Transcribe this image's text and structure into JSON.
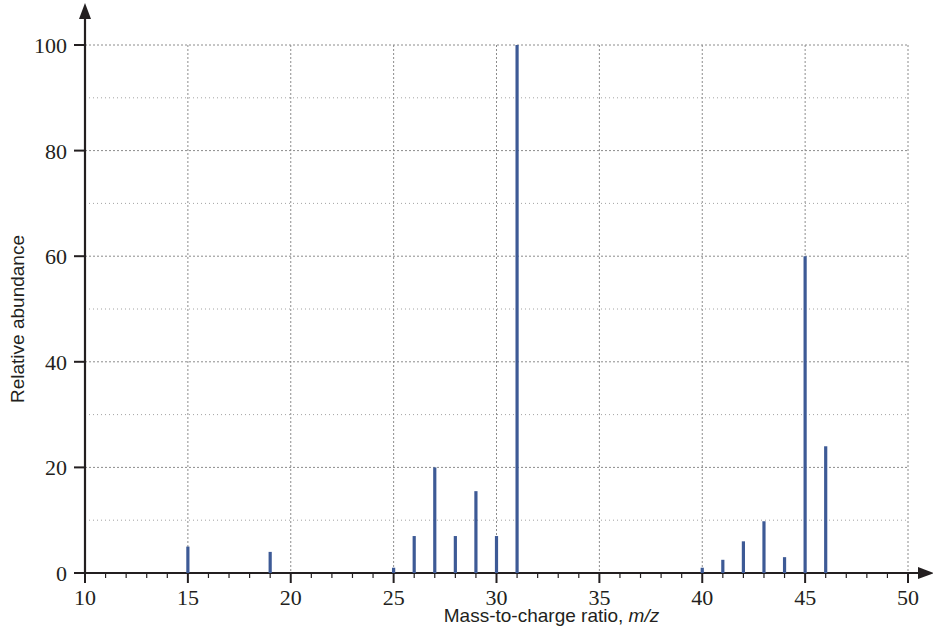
{
  "chart_data": {
    "type": "bar",
    "title": "",
    "subtitle": "",
    "xlabel": "Mass-to-charge ratio, m/z",
    "xlabel_plain": "Mass-to-charge ratio,",
    "xlabel_italic": "m/z",
    "ylabel": "Relative abundance",
    "xlim": [
      10,
      50
    ],
    "ylim": [
      0,
      100
    ],
    "x_major_ticks": [
      10,
      15,
      20,
      25,
      30,
      35,
      40,
      45,
      50
    ],
    "x_tick_labels": [
      "10",
      "15",
      "20",
      "25",
      "30",
      "35",
      "40",
      "45",
      "50"
    ],
    "x_minor_tick_step": 1,
    "y_major_ticks": [
      0,
      20,
      40,
      60,
      80,
      100
    ],
    "y_tick_labels": [
      "0",
      "20",
      "40",
      "60",
      "80",
      "100"
    ],
    "y_minor_ticks": [
      10,
      30,
      50,
      70,
      90
    ],
    "grid": true,
    "grid_color": "#8c8c8c",
    "series_color": "#3d5a96",
    "legend": null,
    "categories": [
      15,
      19,
      25,
      26,
      27,
      28,
      29,
      30,
      31,
      40,
      41,
      42,
      43,
      44,
      45,
      46
    ],
    "values": [
      5,
      4,
      1,
      7,
      20,
      7,
      15.5,
      7,
      100,
      1,
      2.5,
      6,
      9.8,
      3,
      60,
      24
    ],
    "peaks": [
      {
        "mz": 15,
        "abundance": 5
      },
      {
        "mz": 19,
        "abundance": 4
      },
      {
        "mz": 25,
        "abundance": 1
      },
      {
        "mz": 26,
        "abundance": 7
      },
      {
        "mz": 27,
        "abundance": 20
      },
      {
        "mz": 28,
        "abundance": 7
      },
      {
        "mz": 29,
        "abundance": 15.5
      },
      {
        "mz": 30,
        "abundance": 7
      },
      {
        "mz": 31,
        "abundance": 100
      },
      {
        "mz": 40,
        "abundance": 1
      },
      {
        "mz": 41,
        "abundance": 2.5
      },
      {
        "mz": 42,
        "abundance": 6
      },
      {
        "mz": 43,
        "abundance": 9.8
      },
      {
        "mz": 44,
        "abundance": 3
      },
      {
        "mz": 45,
        "abundance": 60
      },
      {
        "mz": 46,
        "abundance": 24
      }
    ]
  }
}
